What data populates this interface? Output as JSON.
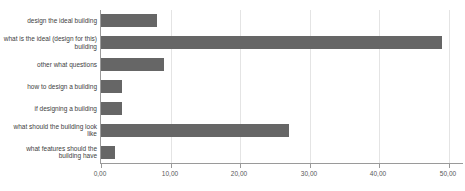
{
  "chart_data": {
    "type": "bar",
    "orientation": "horizontal",
    "title": "",
    "categories": [
      "design the ideal building",
      "what is the ideal (design for this) building",
      "other what questions",
      "how to design a building",
      "if designing a building",
      "what should the building look like",
      "what features should the building have"
    ],
    "values": [
      8,
      49,
      9,
      3,
      3,
      27,
      2
    ],
    "xlabel": "",
    "ylabel": "",
    "xlim": [
      0,
      52
    ],
    "x_ticks": [
      0,
      10,
      20,
      30,
      40,
      50
    ],
    "x_tick_labels": [
      "0,00",
      "10,00",
      "20,00",
      "30,00",
      "40,00",
      "50,00"
    ],
    "grid": "vertical",
    "legend": "none"
  },
  "colors": {
    "background": "#ffffff",
    "bar": "#666666",
    "gridline": "#e4e4e4",
    "axis": "#9a9a9a",
    "tick_text": "#595959",
    "label_text": "#404040"
  }
}
